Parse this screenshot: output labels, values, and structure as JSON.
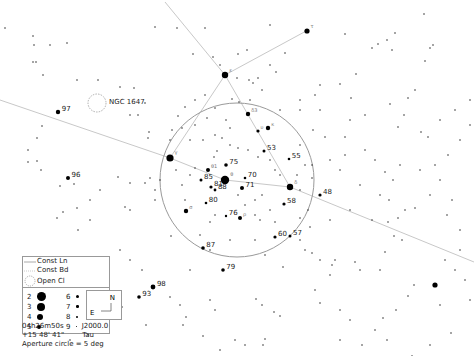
{
  "chart_type": "star-chart",
  "field": {
    "center_ra": "04h26m50s",
    "center_dec": "+15 48' 41\"",
    "epoch": "J2000.0",
    "constellation": "Tau",
    "aperture_note": "Aperture circle = 5 deg",
    "aperture_circle": {
      "cx": 237,
      "cy": 180,
      "r": 77
    }
  },
  "legend": {
    "const_lines_label": "Const Ln",
    "const_boundaries_label": "Const Bd",
    "open_cluster_label": "Open Cl",
    "magnitudes": [
      {
        "mag": "2",
        "size": 9
      },
      {
        "mag": "6",
        "size": 3
      },
      {
        "mag": "3",
        "size": 8
      },
      {
        "mag": "7",
        "size": 2.5
      },
      {
        "mag": "4",
        "size": 6
      },
      {
        "mag": "8",
        "size": 2
      },
      {
        "mag": "5",
        "size": 4
      },
      {
        "mag": "9",
        "size": 1.2
      }
    ]
  },
  "compass": {
    "north": "N",
    "east": "E"
  },
  "objects": [
    {
      "label": "NGC 1647",
      "type": "open-cluster",
      "x": 97,
      "y": 103,
      "lx": 109,
      "ly": 104
    }
  ],
  "constellation_lines": [
    [
      165,
      2,
      225,
      75
    ],
    [
      225,
      75,
      308,
      30
    ],
    [
      225,
      75,
      170,
      158
    ],
    [
      225,
      75,
      290,
      187
    ],
    [
      170,
      158,
      225,
      180
    ],
    [
      225,
      180,
      290,
      187
    ],
    [
      290,
      187,
      474,
      262
    ],
    [
      0,
      100,
      170,
      158
    ]
  ],
  "labeled_stars": [
    {
      "label": "97",
      "x": 58,
      "y": 112,
      "r": 2.2
    },
    {
      "label": "96",
      "x": 68,
      "y": 178,
      "r": 2
    },
    {
      "label": "75",
      "x": 226,
      "y": 165,
      "r": 1.8
    },
    {
      "label": "70",
      "x": 245,
      "y": 178,
      "r": 1.3
    },
    {
      "label": "71",
      "x": 242,
      "y": 188,
      "r": 2
    },
    {
      "label": "85",
      "x": 201,
      "y": 180,
      "r": 1.5
    },
    {
      "label": "81",
      "x": 211,
      "y": 187,
      "r": 1.6
    },
    {
      "label": "88",
      "x": 215,
      "y": 190,
      "r": 1.4
    },
    {
      "label": "80",
      "x": 206,
      "y": 203,
      "r": 1.3
    },
    {
      "label": "76",
      "x": 226,
      "y": 216,
      "r": 1.2
    },
    {
      "label": "58",
      "x": 284,
      "y": 204,
      "r": 1.6
    },
    {
      "label": "55",
      "x": 289,
      "y": 159,
      "r": 1.3
    },
    {
      "label": "53",
      "x": 264,
      "y": 151,
      "r": 1.5
    },
    {
      "label": "48",
      "x": 320,
      "y": 195,
      "r": 1.6
    },
    {
      "label": "60",
      "x": 275,
      "y": 237,
      "r": 1.6
    },
    {
      "label": "57",
      "x": 290,
      "y": 236,
      "r": 1.5
    },
    {
      "label": "87",
      "x": 203,
      "y": 248,
      "r": 1.8
    },
    {
      "label": "79",
      "x": 223,
      "y": 270,
      "r": 1.8
    },
    {
      "label": "98",
      "x": 153,
      "y": 287,
      "r": 2.4
    },
    {
      "label": "93",
      "x": 139,
      "y": 297,
      "r": 1.8
    }
  ],
  "bright_stars": [
    {
      "x": 225,
      "y": 75,
      "r": 3.2,
      "tag": "ε"
    },
    {
      "x": 170,
      "y": 158,
      "r": 3.6,
      "tag": "γ"
    },
    {
      "x": 225,
      "y": 180,
      "r": 4.2,
      "tag": "θ"
    },
    {
      "x": 290,
      "y": 187,
      "r": 3.2,
      "tag": "δ"
    },
    {
      "x": 307,
      "y": 31,
      "r": 2.6,
      "tag": "τ"
    },
    {
      "x": 248,
      "y": 114,
      "r": 2.2,
      "tag": "δ3"
    },
    {
      "x": 268,
      "y": 128,
      "r": 2.2,
      "tag": "κ"
    },
    {
      "x": 258,
      "y": 131,
      "r": 1.6,
      "tag": "υ"
    },
    {
      "x": 435,
      "y": 285,
      "r": 2.6,
      "tag": ""
    },
    {
      "x": 186,
      "y": 211,
      "r": 2.2,
      "tag": "σ"
    },
    {
      "x": 240,
      "y": 218,
      "r": 2,
      "tag": "ρ"
    },
    {
      "x": 208,
      "y": 170,
      "r": 2,
      "tag": "θ1"
    }
  ],
  "faint_stars": [
    [
      5,
      28
    ],
    [
      155,
      27
    ],
    [
      205,
      28
    ],
    [
      270,
      25
    ],
    [
      430,
      48
    ],
    [
      33,
      36
    ],
    [
      50,
      45
    ],
    [
      34,
      45
    ],
    [
      36,
      62
    ],
    [
      67,
      43
    ],
    [
      33,
      62
    ],
    [
      43,
      75
    ],
    [
      77,
      80
    ],
    [
      98,
      80
    ],
    [
      120,
      87
    ],
    [
      134,
      88
    ],
    [
      177,
      28
    ],
    [
      193,
      54
    ],
    [
      238,
      54
    ],
    [
      247,
      50
    ],
    [
      213,
      57
    ],
    [
      237,
      78
    ],
    [
      249,
      80
    ],
    [
      253,
      83
    ],
    [
      258,
      78
    ],
    [
      262,
      90
    ],
    [
      270,
      65
    ],
    [
      276,
      72
    ],
    [
      285,
      53
    ],
    [
      345,
      34
    ],
    [
      372,
      48
    ],
    [
      378,
      44
    ],
    [
      392,
      50
    ],
    [
      387,
      40
    ],
    [
      395,
      33
    ],
    [
      433,
      45
    ],
    [
      425,
      61
    ],
    [
      424,
      14
    ],
    [
      340,
      84
    ],
    [
      356,
      74
    ],
    [
      351,
      98
    ],
    [
      390,
      104
    ],
    [
      398,
      127
    ],
    [
      404,
      115
    ],
    [
      421,
      132
    ],
    [
      428,
      137
    ],
    [
      345,
      137
    ],
    [
      313,
      130
    ],
    [
      325,
      137
    ],
    [
      42,
      126
    ],
    [
      37,
      138
    ],
    [
      28,
      150
    ],
    [
      28,
      162
    ],
    [
      37,
      161
    ],
    [
      41,
      170
    ],
    [
      60,
      186
    ],
    [
      74,
      184
    ],
    [
      77,
      208
    ],
    [
      63,
      212
    ],
    [
      57,
      218
    ],
    [
      90,
      220
    ],
    [
      90,
      200
    ],
    [
      100,
      190
    ],
    [
      138,
      115
    ],
    [
      145,
      103
    ],
    [
      130,
      115
    ],
    [
      170,
      140
    ],
    [
      172,
      130
    ],
    [
      195,
      125
    ],
    [
      155,
      190
    ],
    [
      130,
      210
    ],
    [
      155,
      200
    ],
    [
      148,
      138
    ],
    [
      149,
      132
    ],
    [
      118,
      177
    ],
    [
      125,
      207
    ],
    [
      150,
      178
    ],
    [
      160,
      180
    ],
    [
      145,
      183
    ],
    [
      130,
      183
    ],
    [
      171,
      236
    ],
    [
      200,
      235
    ],
    [
      230,
      240
    ],
    [
      255,
      240
    ],
    [
      265,
      255
    ],
    [
      283,
      267
    ],
    [
      305,
      250
    ],
    [
      312,
      253
    ],
    [
      300,
      240
    ],
    [
      310,
      227
    ],
    [
      330,
      220
    ],
    [
      320,
      260
    ],
    [
      335,
      260
    ],
    [
      355,
      262
    ],
    [
      360,
      270
    ],
    [
      380,
      270
    ],
    [
      394,
      236
    ],
    [
      402,
      240
    ],
    [
      385,
      252
    ],
    [
      408,
      296
    ],
    [
      414,
      285
    ],
    [
      332,
      265
    ],
    [
      330,
      275
    ],
    [
      315,
      290
    ],
    [
      320,
      303
    ],
    [
      340,
      310
    ],
    [
      350,
      320
    ],
    [
      383,
      318
    ],
    [
      396,
      310
    ],
    [
      375,
      330
    ],
    [
      340,
      340
    ],
    [
      362,
      345
    ],
    [
      387,
      340
    ],
    [
      440,
      305
    ],
    [
      451,
      333
    ],
    [
      430,
      345
    ],
    [
      412,
      356
    ],
    [
      445,
      260
    ],
    [
      460,
      250
    ],
    [
      455,
      270
    ],
    [
      465,
      280
    ],
    [
      470,
      300
    ],
    [
      170,
      297
    ],
    [
      180,
      305
    ],
    [
      186,
      317
    ],
    [
      203,
      336
    ],
    [
      183,
      325
    ],
    [
      190,
      270
    ],
    [
      210,
      250
    ],
    [
      256,
      299
    ],
    [
      262,
      305
    ],
    [
      274,
      312
    ],
    [
      280,
      316
    ],
    [
      265,
      339
    ],
    [
      263,
      345
    ],
    [
      245,
      345
    ],
    [
      235,
      340
    ],
    [
      220,
      350
    ],
    [
      215,
      310
    ],
    [
      210,
      300
    ],
    [
      146,
      325
    ],
    [
      120,
      250
    ],
    [
      130,
      260
    ],
    [
      142,
      270
    ],
    [
      105,
      275
    ],
    [
      78,
      230
    ],
    [
      88,
      300
    ],
    [
      70,
      340
    ],
    [
      88,
      335
    ],
    [
      60,
      320
    ],
    [
      102,
      330
    ],
    [
      122,
      307
    ],
    [
      220,
      65
    ],
    [
      205,
      95
    ],
    [
      195,
      100
    ],
    [
      185,
      107
    ],
    [
      232,
      99
    ],
    [
      239,
      102
    ],
    [
      250,
      100
    ],
    [
      215,
      135
    ],
    [
      222,
      138
    ],
    [
      230,
      145
    ],
    [
      238,
      148
    ],
    [
      248,
      150
    ],
    [
      258,
      157
    ],
    [
      270,
      160
    ],
    [
      275,
      170
    ],
    [
      280,
      175
    ],
    [
      297,
      175
    ],
    [
      305,
      165
    ],
    [
      300,
      145
    ],
    [
      312,
      165
    ],
    [
      312,
      178
    ],
    [
      300,
      218
    ],
    [
      308,
      210
    ],
    [
      300,
      190
    ],
    [
      262,
      195
    ],
    [
      255,
      200
    ],
    [
      238,
      195
    ],
    [
      245,
      205
    ],
    [
      255,
      215
    ],
    [
      260,
      220
    ],
    [
      270,
      210
    ],
    [
      275,
      222
    ],
    [
      210,
      222
    ],
    [
      215,
      215
    ],
    [
      185,
      200
    ],
    [
      182,
      185
    ],
    [
      176,
      170
    ],
    [
      190,
      175
    ],
    [
      195,
      168
    ],
    [
      214,
      157
    ],
    [
      217,
      151
    ],
    [
      203,
      140
    ],
    [
      190,
      140
    ],
    [
      182,
      128
    ],
    [
      178,
      116
    ],
    [
      207,
      118
    ],
    [
      215,
      108
    ],
    [
      226,
      120
    ],
    [
      230,
      128
    ],
    [
      380,
      195
    ],
    [
      389,
      200
    ],
    [
      393,
      180
    ],
    [
      385,
      172
    ],
    [
      400,
      165
    ],
    [
      420,
      170
    ],
    [
      435,
      165
    ],
    [
      448,
      155
    ],
    [
      452,
      200
    ],
    [
      447,
      215
    ],
    [
      460,
      230
    ],
    [
      430,
      195
    ],
    [
      440,
      180
    ],
    [
      415,
      208
    ],
    [
      405,
      210
    ],
    [
      398,
      218
    ],
    [
      388,
      222
    ],
    [
      372,
      220
    ],
    [
      350,
      210
    ],
    [
      340,
      170
    ],
    [
      330,
      160
    ],
    [
      345,
      155
    ],
    [
      365,
      150
    ],
    [
      375,
      160
    ],
    [
      360,
      185
    ],
    [
      455,
      110
    ],
    [
      470,
      100
    ],
    [
      415,
      90
    ],
    [
      408,
      98
    ],
    [
      440,
      120
    ],
    [
      460,
      140
    ],
    [
      470,
      125
    ],
    [
      350,
      120
    ],
    [
      365,
      115
    ],
    [
      320,
      110
    ],
    [
      300,
      110
    ],
    [
      300,
      100
    ],
    [
      315,
      95
    ],
    [
      320,
      85
    ],
    [
      280,
      110
    ]
  ]
}
